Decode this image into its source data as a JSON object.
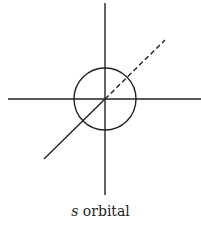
{
  "diagram": {
    "caption": {
      "variable": "s",
      "text": " orbital"
    },
    "colors": {
      "stroke": "#222222",
      "background": "#ffffff"
    },
    "geometry": {
      "center": [
        105,
        99
      ],
      "circle_radius": 31,
      "vertical_axis": [
        [
          105,
          3
        ],
        [
          105,
          195
        ]
      ],
      "horizontal_axis": [
        [
          8,
          99
        ],
        [
          201,
          99
        ]
      ],
      "diagonal_solid": [
        [
          44,
          159
        ],
        [
          105,
          99
        ]
      ],
      "diagonal_dashed": [
        [
          105,
          99
        ],
        [
          165,
          40
        ]
      ]
    }
  }
}
